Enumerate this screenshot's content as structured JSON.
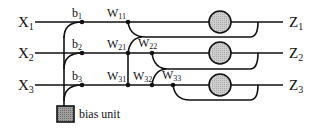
{
  "diagram": {
    "inputs": [
      {
        "letter": "X",
        "sub": "1"
      },
      {
        "letter": "X",
        "sub": "2"
      },
      {
        "letter": "X",
        "sub": "3"
      }
    ],
    "outputs": [
      {
        "letter": "Z",
        "sub": "1"
      },
      {
        "letter": "Z",
        "sub": "2"
      },
      {
        "letter": "Z",
        "sub": "3"
      }
    ],
    "biases": [
      {
        "letter": "b",
        "sub": "1"
      },
      {
        "letter": "b",
        "sub": "2"
      },
      {
        "letter": "b",
        "sub": "3"
      }
    ],
    "weights": [
      {
        "letter": "W",
        "sub": "11"
      },
      {
        "letter": "W",
        "sub": "21"
      },
      {
        "letter": "W",
        "sub": "22"
      },
      {
        "letter": "W",
        "sub": "31"
      },
      {
        "letter": "W",
        "sub": "32"
      },
      {
        "letter": "W",
        "sub": "33"
      }
    ],
    "bias_unit_label": "bias unit",
    "colors": {
      "line": "#111111",
      "node_fill": "#c8c8c8",
      "bias_fill": "#9a9a9a"
    }
  }
}
